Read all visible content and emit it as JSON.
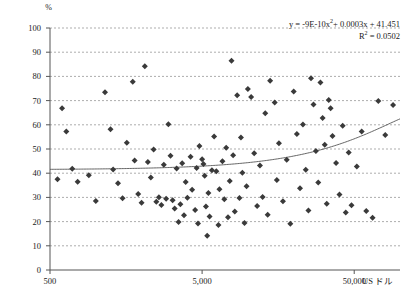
{
  "chart_data": {
    "type": "scatter",
    "title": "",
    "xlabel": "US ドル",
    "ylabel": "%",
    "xscale": "log",
    "xlim": [
      500,
      100000
    ],
    "ylim": [
      0,
      100
    ],
    "grid": true,
    "grid_style": "dashed-horizontal",
    "legend": "none",
    "xticks": [
      "500",
      "5,000",
      "50,000"
    ],
    "xtick_values": [
      500,
      5000,
      50000
    ],
    "yticks": [
      "0",
      "10",
      "20",
      "30",
      "40",
      "50",
      "60",
      "70",
      "80",
      "90",
      "100"
    ],
    "ytick_values": [
      0,
      10,
      20,
      30,
      40,
      50,
      60,
      70,
      80,
      90,
      100
    ],
    "annotations": {
      "equation": "y = -9E-10x²+ 0.0003x + 41.451",
      "equation_parts": {
        "lhs": "y = -9E-10x",
        "exponent": "2",
        "rhs": "+ 0.0003x + 41.451"
      },
      "r_squared_label": "R",
      "r_squared_exponent": "2",
      "r_squared_value": " = 0.0502"
    },
    "trendline": {
      "type": "polynomial",
      "order": 2,
      "a": -9e-10,
      "b": 0.0003,
      "c": 41.451,
      "color": "#555555"
    },
    "marker": {
      "shape": "diamond",
      "color": "#3a3a3a",
      "size": 3
    },
    "points": [
      [
        560,
        37.5
      ],
      [
        600,
        66.8
      ],
      [
        640,
        57.2
      ],
      [
        700,
        41.8
      ],
      [
        760,
        36.5
      ],
      [
        900,
        39.2
      ],
      [
        1000,
        28.5
      ],
      [
        1150,
        73.5
      ],
      [
        1250,
        58.2
      ],
      [
        1300,
        41.5
      ],
      [
        1400,
        35.8
      ],
      [
        1500,
        29.6
      ],
      [
        1600,
        52.6
      ],
      [
        1750,
        77.8
      ],
      [
        1800,
        45.2
      ],
      [
        1900,
        31.4
      ],
      [
        2000,
        27.8
      ],
      [
        2100,
        84.2
      ],
      [
        2200,
        44.6
      ],
      [
        2300,
        38.2
      ],
      [
        2400,
        49.8
      ],
      [
        2500,
        28.2
      ],
      [
        2600,
        30.1
      ],
      [
        2700,
        26.9
      ],
      [
        2800,
        43.5
      ],
      [
        2900,
        29.4
      ],
      [
        3000,
        60.2
      ],
      [
        3100,
        47.2
      ],
      [
        3200,
        28.8
      ],
      [
        3300,
        25.4
      ],
      [
        3400,
        41.9
      ],
      [
        3500,
        19.8
      ],
      [
        3600,
        27.2
      ],
      [
        3700,
        44.1
      ],
      [
        3800,
        22.6
      ],
      [
        3900,
        36.4
      ],
      [
        4000,
        29.9
      ],
      [
        4200,
        46.8
      ],
      [
        4300,
        33.2
      ],
      [
        4500,
        24.8
      ],
      [
        4600,
        42.2
      ],
      [
        4700,
        19.2
      ],
      [
        4800,
        51.2
      ],
      [
        5000,
        45.8
      ],
      [
        5100,
        43.8
      ],
      [
        5200,
        38.9
      ],
      [
        5300,
        26.2
      ],
      [
        5400,
        14.2
      ],
      [
        5500,
        31.8
      ],
      [
        5600,
        22.1
      ],
      [
        5800,
        41.2
      ],
      [
        6000,
        55.2
      ],
      [
        6200,
        40.8
      ],
      [
        6400,
        18.6
      ],
      [
        6500,
        33.4
      ],
      [
        6800,
        44.9
      ],
      [
        7000,
        29.2
      ],
      [
        7200,
        50.5
      ],
      [
        7400,
        21.8
      ],
      [
        7600,
        36.8
      ],
      [
        7800,
        86.5
      ],
      [
        8000,
        47.4
      ],
      [
        8200,
        24.2
      ],
      [
        8500,
        72.2
      ],
      [
        8800,
        29.8
      ],
      [
        9000,
        54.8
      ],
      [
        9200,
        40.2
      ],
      [
        9500,
        19.4
      ],
      [
        9800,
        34.6
      ],
      [
        10000,
        74.8
      ],
      [
        10500,
        71.5
      ],
      [
        11000,
        48.2
      ],
      [
        11500,
        26.4
      ],
      [
        12000,
        43.2
      ],
      [
        12500,
        30.2
      ],
      [
        13000,
        64.8
      ],
      [
        13500,
        22.8
      ],
      [
        14000,
        78.2
      ],
      [
        15000,
        69.2
      ],
      [
        15500,
        37.2
      ],
      [
        16000,
        52.4
      ],
      [
        17000,
        28.4
      ],
      [
        18000,
        45.6
      ],
      [
        19000,
        19.1
      ],
      [
        20000,
        73.8
      ],
      [
        21000,
        56.2
      ],
      [
        22000,
        33.8
      ],
      [
        23000,
        60.1
      ],
      [
        24000,
        41.4
      ],
      [
        25000,
        24.6
      ],
      [
        26000,
        79.2
      ],
      [
        27000,
        68.4
      ],
      [
        28000,
        49.2
      ],
      [
        29000,
        36.2
      ],
      [
        30000,
        77.5
      ],
      [
        31000,
        62.8
      ],
      [
        32000,
        51.8
      ],
      [
        33000,
        27.4
      ],
      [
        34000,
        70.2
      ],
      [
        35000,
        66.8
      ],
      [
        36000,
        55.4
      ],
      [
        38000,
        44.2
      ],
      [
        40000,
        31.2
      ],
      [
        42000,
        59.6
      ],
      [
        44000,
        23.8
      ],
      [
        46000,
        48.6
      ],
      [
        48000,
        26.8
      ],
      [
        52000,
        42.8
      ],
      [
        56000,
        57.2
      ],
      [
        60000,
        24.4
      ],
      [
        66000,
        21.6
      ],
      [
        72000,
        69.8
      ],
      [
        80000,
        55.8
      ],
      [
        90000,
        68.2
      ]
    ]
  }
}
